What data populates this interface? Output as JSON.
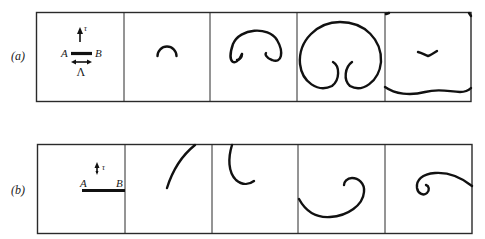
{
  "figure": {
    "rows": [
      {
        "label": "(a)",
        "panel_count": 5,
        "initial_panel": {
          "point_a": "A",
          "point_b": "B",
          "velocity_symbol": "τ",
          "length_symbol": "Λ"
        },
        "stages": [
          "small arc",
          "horseshoe with curled ends",
          "large loop with inward-curled ends",
          "wavy sheet with small chevron"
        ]
      },
      {
        "label": "(b)",
        "panel_count": 5,
        "initial_panel": {
          "point_a": "A",
          "point_b": "B",
          "velocity_symbol": "τ"
        },
        "stages": [
          "rising arc",
          "hook curve",
          "spiral roll-up",
          "tight spiral with tail"
        ]
      }
    ]
  }
}
